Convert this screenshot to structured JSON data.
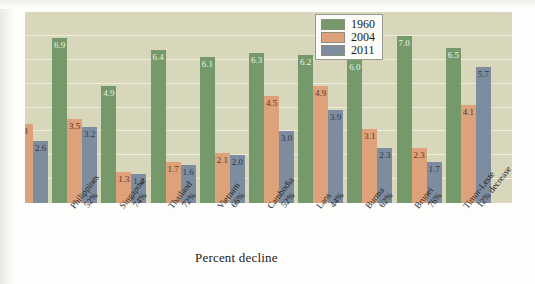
{
  "chart_data": {
    "type": "bar",
    "title": "",
    "xlabel": "Percent decline",
    "ylabel": "",
    "ylim": [
      0,
      8
    ],
    "grid": true,
    "legend_position": "top-right",
    "categories": [
      "Philippines",
      "Singapore",
      "Thailand",
      "Vietnam",
      "Cambodia",
      "Laos",
      "Burma",
      "Brunei",
      "Timor-Leste"
    ],
    "category_sublabels": [
      "52%",
      "74%",
      "72%",
      "66%",
      "52%",
      "44%",
      "62%",
      "76%",
      "12% decrease"
    ],
    "series": [
      {
        "name": "1960",
        "color": "#75996a",
        "values": [
          6.9,
          4.9,
          6.4,
          6.1,
          6.3,
          6.2,
          6.0,
          7.0,
          6.5
        ]
      },
      {
        "name": "2004",
        "color": "#dda279",
        "values": [
          3.5,
          1.3,
          1.7,
          2.1,
          4.5,
          4.9,
          3.1,
          2.3,
          4.1
        ]
      },
      {
        "name": "2011",
        "color": "#7d8c9e",
        "values": [
          3.2,
          1.2,
          1.6,
          2.0,
          3.0,
          3.9,
          2.3,
          1.7,
          5.7
        ]
      }
    ],
    "clipped_left_group": {
      "note": "partially cropped group at left edge of image",
      "bars": [
        {
          "series": "2004",
          "label": "3",
          "value": 3.3
        },
        {
          "series": "2011",
          "label": "2.6",
          "value": 2.6
        }
      ]
    }
  },
  "legend": {
    "items": [
      {
        "label": "1960",
        "color": "#75996a"
      },
      {
        "label": "2004",
        "color": "#dda279"
      },
      {
        "label": "2011",
        "color": "#7d8c9e"
      }
    ]
  },
  "axis": {
    "caption": "Percent decline"
  },
  "colors": {
    "plot_background": "#d8d7bb",
    "gridline": "#efeedd",
    "page_background": "#ffffff"
  }
}
